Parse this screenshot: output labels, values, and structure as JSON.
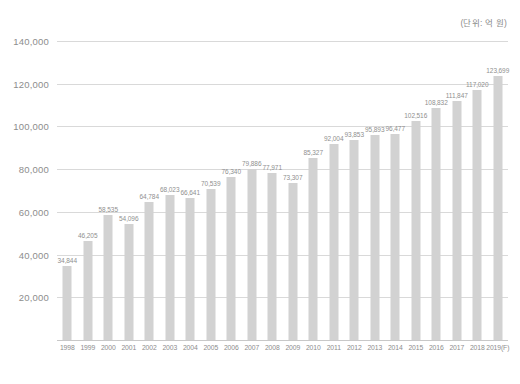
{
  "unit_caption": "(단위: 억 원)",
  "chart_data": {
    "type": "bar",
    "title": "",
    "subtitle": "",
    "xlabel": "",
    "ylabel": "",
    "unit_note": "(단위: 억 원)",
    "grid": true,
    "legend": "none",
    "ylim": [
      0,
      140000
    ],
    "yticks": [
      20000,
      40000,
      60000,
      80000,
      100000,
      120000,
      140000
    ],
    "ytick_labels": [
      "20,000",
      "40,000",
      "60,000",
      "80,000",
      "100,000",
      "120,000",
      "140,000"
    ],
    "categories": [
      "1998",
      "1999",
      "2000",
      "2001",
      "2002",
      "2003",
      "2004",
      "2005",
      "2006",
      "2007",
      "2008",
      "2009",
      "2010",
      "2011",
      "2012",
      "2013",
      "2014",
      "2015",
      "2016",
      "2017",
      "2018",
      "2019(F)"
    ],
    "values": [
      34844,
      46205,
      58535,
      54096,
      64784,
      68023,
      66641,
      70539,
      76340,
      79886,
      77971,
      73307,
      85327,
      92004,
      93853,
      95893,
      96477,
      102516,
      108832,
      111847,
      117020,
      123699
    ],
    "value_labels": [
      "34,844",
      "46,205",
      "58,535",
      "54,096",
      "64,784",
      "68,023",
      "66,641",
      "70,539",
      "76,340",
      "79,886",
      "77,971",
      "73,307",
      "85,327",
      "92,004",
      "93,853",
      "95,893",
      "96,477",
      "102,516",
      "108,832",
      "111,847",
      "117,020",
      "123,699"
    ],
    "bar_color": "#d2d2d2",
    "grid_color": "#d9d9d9",
    "text_color": "#8d8d8d"
  }
}
